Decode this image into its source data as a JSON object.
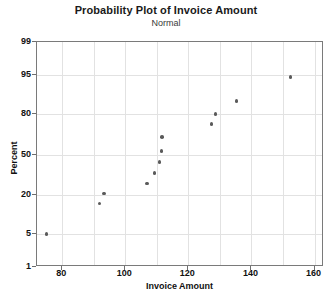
{
  "chart_data": {
    "type": "scatter",
    "title": "Probability Plot of Invoice Amount",
    "subtitle": "Normal",
    "xlabel": "Invoice Amount",
    "ylabel": "Percent",
    "xlim": [
      72,
      163
    ],
    "ylim": [
      1,
      99
    ],
    "grid": true,
    "legend": null,
    "x_ticks": [
      80,
      100,
      120,
      140,
      160
    ],
    "y_ticks": [
      1,
      5,
      20,
      50,
      80,
      95,
      99
    ],
    "x_tick_labels": [
      "80",
      "100",
      "120",
      "140",
      "160"
    ],
    "y_tick_labels": [
      "1",
      "5",
      "20",
      "50",
      "80",
      "95",
      "99"
    ],
    "y_scale": "normal-probability",
    "marker_color": "#5a5a5a",
    "points": [
      {
        "x": 75.0,
        "y": 5.0
      },
      {
        "x": 91.8,
        "y": 15.5
      },
      {
        "x": 93.2,
        "y": 21.0
      },
      {
        "x": 106.8,
        "y": 27.5
      },
      {
        "x": 109.3,
        "y": 35.0
      },
      {
        "x": 110.9,
        "y": 44.0
      },
      {
        "x": 111.5,
        "y": 53.0
      },
      {
        "x": 111.6,
        "y": 64.0
      },
      {
        "x": 127.3,
        "y": 73.5
      },
      {
        "x": 128.6,
        "y": 80.0
      },
      {
        "x": 135.2,
        "y": 86.5
      },
      {
        "x": 152.4,
        "y": 94.5
      }
    ]
  }
}
